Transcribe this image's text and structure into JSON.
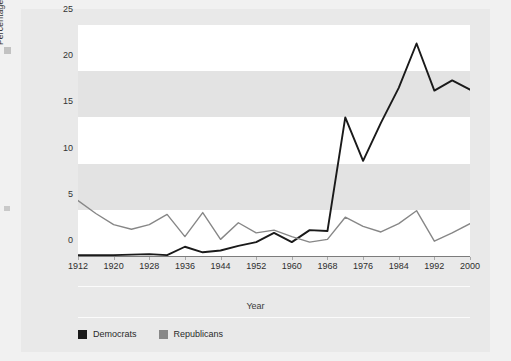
{
  "figure": {
    "background_color": "#e9e9e9",
    "page_background_color": "#f1f1f1"
  },
  "axes": {
    "y_title": "Percentage Black Delegates",
    "x_title": "Year"
  },
  "legend": {
    "items": [
      {
        "label": "Democrats",
        "color": "#1a1a1a"
      },
      {
        "label": "Republicans",
        "color": "#878787"
      }
    ]
  },
  "chart_data": {
    "type": "line",
    "title": "",
    "xlabel": "Year",
    "ylabel": "Percentage Black Delegates",
    "xlim": [
      1912,
      2000
    ],
    "ylim": [
      0,
      25
    ],
    "ytick_labels": [
      "0",
      "5",
      "10",
      "15",
      "20",
      "25"
    ],
    "yticks": [
      0,
      5,
      10,
      15,
      20,
      25
    ],
    "xtick_labels": [
      "1912",
      "1920",
      "1928",
      "1936",
      "1944",
      "1952",
      "1960",
      "1968",
      "1976",
      "1984",
      "1992",
      "2000"
    ],
    "xticks": [
      1912,
      1920,
      1928,
      1936,
      1944,
      1952,
      1960,
      1968,
      1976,
      1984,
      1992,
      2000
    ],
    "x": [
      1912,
      1916,
      1920,
      1924,
      1928,
      1932,
      1936,
      1940,
      1944,
      1948,
      1952,
      1956,
      1960,
      1964,
      1968,
      1972,
      1976,
      1980,
      1984,
      1988,
      1992,
      1996,
      2000
    ],
    "grid": "horizontal alternating bands every 5 units",
    "legend_position": "below-axis-left",
    "series": [
      {
        "name": "Democrats",
        "color": "#1a1a1a",
        "values": [
          0.1,
          0.1,
          0.1,
          0.15,
          0.2,
          0.1,
          1.0,
          0.4,
          0.6,
          1.1,
          1.5,
          2.5,
          1.5,
          2.8,
          2.7,
          15.0,
          10.3,
          14.4,
          18.2,
          23.0,
          17.9,
          19.0,
          18.0
        ]
      },
      {
        "name": "Republicans",
        "color": "#878787",
        "values": [
          6.0,
          4.6,
          3.4,
          2.9,
          3.4,
          4.5,
          2.1,
          4.7,
          1.8,
          3.6,
          2.5,
          2.8,
          2.1,
          1.5,
          1.8,
          4.2,
          3.2,
          2.6,
          3.5,
          4.9,
          1.6,
          2.5,
          3.5
        ]
      }
    ]
  }
}
